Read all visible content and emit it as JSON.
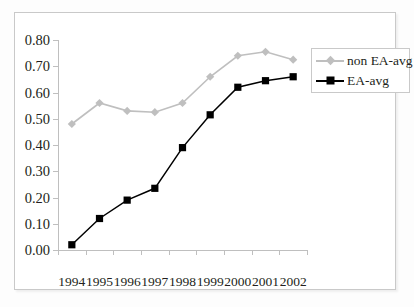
{
  "chart_data": {
    "type": "line",
    "title": "",
    "subtitle": "",
    "xlabel": "",
    "ylabel": "",
    "categories": [
      "1994",
      "1995",
      "1996",
      "1997",
      "1998",
      "1999",
      "2000",
      "2001",
      "2002"
    ],
    "series": [
      {
        "name": "non EA-avg",
        "color": "#bfbfbf",
        "marker": "diamond",
        "values": [
          0.48,
          0.56,
          0.53,
          0.525,
          0.56,
          0.66,
          0.74,
          0.755,
          0.725
        ]
      },
      {
        "name": "EA-avg",
        "color": "#000000",
        "marker": "square",
        "values": [
          0.02,
          0.12,
          0.19,
          0.235,
          0.39,
          0.515,
          0.62,
          0.645,
          0.66
        ]
      }
    ],
    "ylim": [
      0.0,
      0.8
    ],
    "ytick_step": 0.1,
    "ytick_labels": [
      "0.80",
      "0.70",
      "0.60",
      "0.50",
      "0.40",
      "0.30",
      "0.20",
      "0.10",
      "0.00"
    ],
    "ytick_values": [
      0.8,
      0.7,
      0.6,
      0.5,
      0.4,
      0.3,
      0.2,
      0.1,
      0.0
    ],
    "grid": false,
    "legend_position": "top-right",
    "legend_entries": [
      "non EA-avg",
      "EA-avg"
    ],
    "axis_color": "#bfbfbf",
    "plot_background": "#ffffff",
    "frame_color": "#c9c9c9"
  }
}
